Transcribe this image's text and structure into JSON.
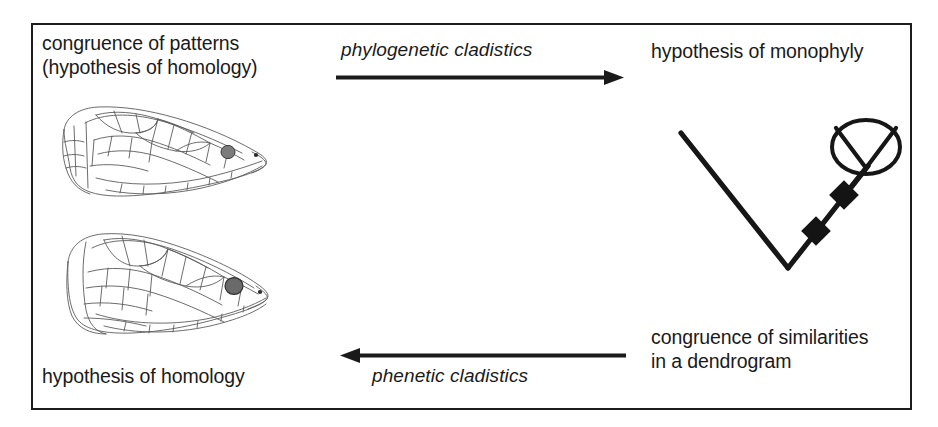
{
  "figure": {
    "frame_color": "#1c1c1c",
    "background_color": "#ffffff",
    "ink_color": "#1a1a1a"
  },
  "labels": {
    "congruence_of_patterns": "congruence of patterns\n(hypothesis of homology)",
    "phylogenetic_cladistics": "phylogenetic cladistics",
    "hypothesis_of_monophyly": "hypothesis of monophyly",
    "congruence_of_similarities": "congruence of similarities\nin a dendrogram",
    "hypothesis_of_homology": "hypothesis of homology",
    "phenetic_cladistics": "phenetic cladistics"
  },
  "arrows": [
    {
      "name": "arrow-forward-top",
      "direction": "right",
      "from_label": "congruence of patterns (hypothesis of homology)",
      "to_label": "hypothesis of monophyly",
      "process_label": "phylogenetic cladistics"
    },
    {
      "name": "arrow-backward-bottom",
      "direction": "left",
      "from_label": "congruence of similarities in a dendrogram",
      "to_label": "hypothesis of homology",
      "process_label": "phenetic cladistics"
    }
  ],
  "illustrations": [
    {
      "name": "snake-head-top",
      "description": "line drawing of a snake head in lateral-oblique view with scale pattern, eye shaded dark"
    },
    {
      "name": "snake-head-bottom",
      "description": "line drawing of a second snake head in lateral-oblique view with scale pattern, eye shaded dark"
    }
  ],
  "cladogram": {
    "name": "cladogram",
    "description": "V-shaped cladogram with two filled diamond character-state markers on the right branch terminating in an ellipse containing a forked (monophyletic group) symbol",
    "node_markers": 2,
    "marker_shape": "filled-diamond",
    "terminal_symbol": "ellipse-with-fork"
  }
}
